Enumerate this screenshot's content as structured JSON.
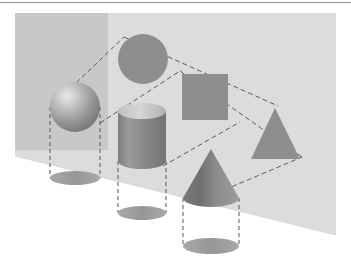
{
  "page": {
    "background_color": "#ffffff",
    "width": 351,
    "height": 279
  },
  "top_rule": {
    "color": "#8e9094",
    "y": 2,
    "width": 351,
    "thickness": 1.4
  },
  "figure": {
    "title": "Projections of three-dimensional solids onto a plane",
    "canvas": {
      "x": 0,
      "y": 8,
      "width": 351,
      "height": 262
    },
    "backdrop": {
      "name": "back-wall",
      "fill": "#dcdcdc",
      "x": 15,
      "y": 5,
      "width": 321,
      "height": 222
    },
    "backdrop_shadow_band": {
      "name": "wall-shadow-band",
      "fill": "#c8c8c8",
      "x": 15,
      "y": 5,
      "width": 93,
      "height": 137
    },
    "floor": {
      "name": "floor-plane",
      "fill": "#ffffff",
      "edge_left": [
        15,
        148
      ],
      "edge_right": [
        336,
        227
      ]
    },
    "solids": [
      {
        "name": "sphere",
        "label": "Sphere",
        "cx": 75,
        "cy": 99,
        "r": 25,
        "fill": "#9a9a9a",
        "highlight": "#e4e4e4"
      },
      {
        "name": "cylinder",
        "label": "Cylinder",
        "cx": 142,
        "top_y": 103,
        "bottom_y": 153,
        "rx": 24,
        "ry": 8,
        "fill": "#8f8f8f",
        "cap_fill": "#c9c9c9"
      },
      {
        "name": "cone",
        "label": "Cone",
        "apex": [
          211,
          141
        ],
        "base_cy": 190,
        "rx": 28,
        "ry": 9,
        "fill": "#8f8f8f",
        "shade_fill": "#767676"
      }
    ],
    "projections_2d": [
      {
        "name": "circle-projection",
        "label": "Circle",
        "cx": 143,
        "cy": 51,
        "r": 25,
        "fill": "#8e8e8e"
      },
      {
        "name": "square-projection",
        "label": "Square",
        "x": 182,
        "y": 66,
        "width": 46,
        "height": 46,
        "fill": "#8e8e8e"
      },
      {
        "name": "triangle-projection",
        "label": "Triangle",
        "apex": [
          275,
          100
        ],
        "base_left": [
          251,
          151
        ],
        "base_right": [
          300,
          151
        ],
        "fill": "#8e8e8e"
      }
    ],
    "shadows": [
      {
        "name": "sphere-shadow",
        "cx": 75,
        "cy": 170,
        "rx": 25,
        "ry": 7,
        "fill": "#9d9d9d"
      },
      {
        "name": "cylinder-shadow",
        "cx": 142,
        "cy": 205,
        "rx": 24,
        "ry": 7,
        "fill": "#9d9d9d"
      },
      {
        "name": "cone-shadow",
        "cx": 211,
        "cy": 238,
        "rx": 28,
        "ry": 8,
        "fill": "#9d9d9d"
      }
    ],
    "drop_lines": {
      "name": "vertical-drop-lines",
      "stroke": "#555555",
      "dash": "4 3",
      "pairs": [
        {
          "x1": 50,
          "x2": 50,
          "y_top": 99,
          "y_bottom": 170
        },
        {
          "x1": 100,
          "x2": 100,
          "y_top": 99,
          "y_bottom": 170
        },
        {
          "x1": 118,
          "x2": 118,
          "y_top": 153,
          "y_bottom": 205
        },
        {
          "x1": 166,
          "x2": 166,
          "y_top": 153,
          "y_bottom": 205
        },
        {
          "x1": 183,
          "x2": 183,
          "y_top": 190,
          "y_bottom": 238
        },
        {
          "x1": 239,
          "x2": 239,
          "y_top": 190,
          "y_bottom": 238
        }
      ]
    },
    "projection_rays": {
      "name": "projection-rays",
      "stroke": "#5a5a5a",
      "dash": "5 3",
      "lines": [
        {
          "from": [
            53,
            97
          ],
          "to": [
            124,
            29
          ]
        },
        {
          "from": [
            100,
            115
          ],
          "to": [
            180,
            63
          ]
        },
        {
          "from": [
            163,
            158
          ],
          "to": [
            240,
            114
          ]
        },
        {
          "from": [
            210,
            188
          ],
          "to": [
            302,
            149
          ]
        },
        {
          "from": [
            124,
            29
          ],
          "to": [
            278,
            98
          ]
        },
        {
          "from": [
            180,
            63
          ],
          "to": [
            302,
            149
          ]
        }
      ]
    },
    "palette": {
      "wall": "#dcdcdc",
      "wall_shadow": "#c8c8c8",
      "solid_gray": "#8f8f8f",
      "shape_gray": "#8e8e8e",
      "shadow_gray": "#9d9d9d",
      "line_gray": "#555555",
      "floor": "#ffffff"
    }
  }
}
